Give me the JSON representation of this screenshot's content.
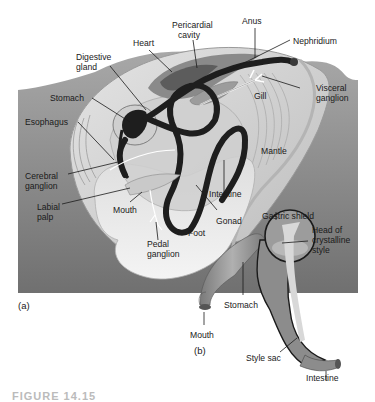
{
  "figure": {
    "caption_partial": "FIGURE 14.15",
    "colors": {
      "background_panel": "#8a8a8a",
      "shell": "#d6d6d6",
      "foot": "#e8e8e8",
      "gut_tube": "#1e1e1e",
      "stomach_b": "#9a9a9a",
      "label_text": "#1a1a1a"
    }
  },
  "panel_a": {
    "tag": "(a)",
    "labels": {
      "anus": "Anus",
      "pericardial_cavity_1": "Pericardial",
      "pericardial_cavity_2": "cavity",
      "heart": "Heart",
      "nephridium": "Nephridium",
      "digestive_gland_1": "Digestive",
      "digestive_gland_2": "gland",
      "visceral_ganglion_1": "Visceral",
      "visceral_ganglion_2": "ganglion",
      "gill": "Gill",
      "stomach": "Stomach",
      "esophagus": "Esophagus",
      "mantle": "Mantle",
      "cerebral_ganglion_1": "Cerebral",
      "cerebral_ganglion_2": "ganglion",
      "intestine": "Intestine",
      "labial_palp_1": "Labial",
      "labial_palp_2": "palp",
      "mouth": "Mouth",
      "gonad": "Gonad",
      "foot": "Foot",
      "pedal_ganglion_1": "Pedal",
      "pedal_ganglion_2": "ganglion"
    }
  },
  "panel_b": {
    "tag": "(b)",
    "labels": {
      "gastric_shield": "Gastric shield",
      "head_of_style_1": "Head of",
      "head_of_style_2": "crystalline",
      "head_of_style_3": "style",
      "stomach": "Stomach",
      "mouth": "Mouth",
      "style_sac": "Style sac",
      "intestine": "Intestine"
    }
  }
}
